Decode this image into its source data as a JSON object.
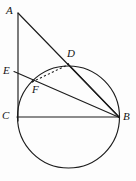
{
  "figure": {
    "width": 136,
    "height": 181,
    "background_color": "#fdfdfd",
    "stroke_color": "#1c1c1c",
    "label_color": "#141414"
  },
  "labels": {
    "a": "A",
    "b": "B",
    "c": "C",
    "d": "D",
    "e": "E",
    "f": "F"
  },
  "geometry": {
    "circle": {
      "name": "main-circle",
      "cx": 68.5,
      "cy": 117,
      "r": 51,
      "style": "solid"
    },
    "points": [
      {
        "id": "A",
        "x": 18,
        "y": 13,
        "label_x": 7,
        "label_y": 6,
        "on_circle": false
      },
      {
        "id": "E",
        "x": 18,
        "y": 73,
        "label_x": 4,
        "label_y": 66,
        "on_circle": false
      },
      {
        "id": "C",
        "x": 18,
        "y": 117,
        "label_x": 3,
        "label_y": 110,
        "on_circle": true
      },
      {
        "id": "B",
        "x": 119,
        "y": 117,
        "label_x": 124,
        "label_y": 111,
        "on_circle": true
      },
      {
        "id": "D",
        "x": 68,
        "y": 64,
        "label_x": 68,
        "label_y": 49,
        "on_circle": true
      },
      {
        "id": "F",
        "x": 33,
        "y": 82,
        "label_x": 33,
        "label_y": 82,
        "on_circle": true
      }
    ],
    "segments": [
      {
        "id": "AC",
        "from": "A",
        "to": "C",
        "style": "solid",
        "x1": 18,
        "y1": 13,
        "x2": 18,
        "y2": 120
      },
      {
        "id": "AB",
        "from": "A",
        "to": "B",
        "style": "solid",
        "x1": 18,
        "y1": 13,
        "x2": 119,
        "y2": 117
      },
      {
        "id": "CB",
        "from": "C",
        "to": "B",
        "style": "solid",
        "x1": 18,
        "y1": 117,
        "x2": 119,
        "y2": 117
      },
      {
        "id": "EB",
        "from": "E",
        "to": "B",
        "style": "solid",
        "x1": 18,
        "y1": 73,
        "x2": 119,
        "y2": 117
      },
      {
        "id": "DB",
        "from": "D",
        "to": "B",
        "style": "solid",
        "x1": 68,
        "y1": 64,
        "x2": 119,
        "y2": 117
      },
      {
        "id": "FD",
        "from": "F",
        "to": "D",
        "style": "dashed",
        "x1": 33,
        "y1": 82,
        "x2": 68,
        "y2": 64
      }
    ]
  }
}
